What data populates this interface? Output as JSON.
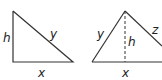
{
  "figures": [
    {
      "name": "right-triangle",
      "labels": {
        "height": "h",
        "hypotenuse": "y",
        "base": "x"
      },
      "vertices": [
        [
          13,
          11
        ],
        [
          13,
          62
        ],
        [
          73,
          62
        ]
      ]
    },
    {
      "name": "triangle-with-altitude",
      "labels": {
        "left_side": "y",
        "altitude": "h",
        "right_side": "z",
        "base": "x"
      },
      "vertices": [
        [
          92,
          62
        ],
        [
          124,
          11
        ],
        [
          162,
          50
        ]
      ]
    }
  ],
  "colors": {
    "stroke": "#333333",
    "text": "#222222"
  }
}
